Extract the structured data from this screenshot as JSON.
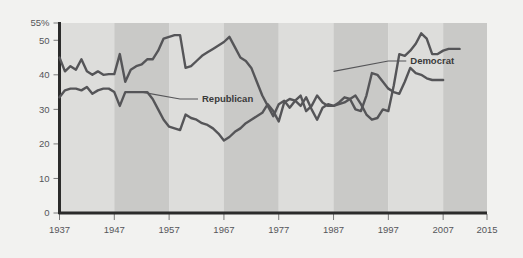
{
  "chart_data": {
    "type": "line",
    "title": "",
    "subtitle": "",
    "xlabel": "",
    "ylabel": "",
    "xlim": [
      1937,
      2015
    ],
    "ylim": [
      0,
      55
    ],
    "grid": false,
    "legend_position": "inline-annotation",
    "y_ticks": [
      0,
      10,
      20,
      30,
      40,
      50,
      55
    ],
    "y_tick_labels": [
      "0",
      "10",
      "20",
      "30",
      "40",
      "50",
      "55%"
    ],
    "x_ticks": [
      1937,
      1947,
      1957,
      1967,
      1977,
      1987,
      1997,
      2007,
      2015
    ],
    "x_tick_labels": [
      "1937",
      "1947",
      "1957",
      "1967",
      "1977",
      "1987",
      "1997",
      "2007",
      "2015"
    ],
    "band_shading": {
      "light_color": "#dddddb",
      "dark_color": "#c9c9c7",
      "period_years": 10,
      "start_year": 1937
    },
    "series": [
      {
        "name": "Democrat",
        "label": "Democrat",
        "color": "#555558",
        "label_x": 2001,
        "label_y": 44,
        "points": [
          [
            1937,
            45.0
          ],
          [
            1938,
            41.0
          ],
          [
            1939,
            42.5
          ],
          [
            1940,
            41.5
          ],
          [
            1941,
            44.5
          ],
          [
            1942,
            41.0
          ],
          [
            1943,
            40.0
          ],
          [
            1944,
            41.0
          ],
          [
            1945,
            40.0
          ],
          [
            1946,
            40.2
          ],
          [
            1947,
            40.2
          ],
          [
            1948,
            46.0
          ],
          [
            1949,
            38.0
          ],
          [
            1950,
            41.5
          ],
          [
            1951,
            42.5
          ],
          [
            1952,
            43.0
          ],
          [
            1953,
            44.5
          ],
          [
            1954,
            44.5
          ],
          [
            1955,
            47.0
          ],
          [
            1956,
            50.5
          ],
          [
            1957,
            51.0
          ],
          [
            1958,
            51.5
          ],
          [
            1959,
            51.5
          ],
          [
            1960,
            42.0
          ],
          [
            1961,
            42.5
          ],
          [
            1962,
            44.0
          ],
          [
            1963,
            45.5
          ],
          [
            1964,
            46.5
          ],
          [
            1965,
            47.5
          ],
          [
            1966,
            48.5
          ],
          [
            1967,
            49.5
          ],
          [
            1968,
            51.0
          ],
          [
            1969,
            48.0
          ],
          [
            1970,
            45.0
          ],
          [
            1971,
            44.0
          ],
          [
            1972,
            42.0
          ],
          [
            1973,
            38.0
          ],
          [
            1974,
            34.0
          ],
          [
            1975,
            31.0
          ],
          [
            1976,
            28.0
          ],
          [
            1977,
            31.5
          ],
          [
            1978,
            32.5
          ],
          [
            1979,
            30.5
          ],
          [
            1980,
            32.5
          ],
          [
            1981,
            31.0
          ],
          [
            1982,
            33.5
          ],
          [
            1983,
            30.0
          ],
          [
            1984,
            27.0
          ],
          [
            1985,
            30.5
          ],
          [
            1986,
            31.5
          ],
          [
            1987,
            31.0
          ],
          [
            1988,
            31.5
          ],
          [
            1989,
            32.0
          ],
          [
            1990,
            33.0
          ],
          [
            1991,
            34.0
          ],
          [
            1992,
            31.5
          ],
          [
            1993,
            28.5
          ],
          [
            1994,
            27.0
          ],
          [
            1995,
            27.5
          ],
          [
            1996,
            30.0
          ],
          [
            1997,
            29.5
          ],
          [
            1998,
            37.0
          ],
          [
            1999,
            46.0
          ],
          [
            2000,
            45.5
          ],
          [
            2001,
            47.0
          ],
          [
            2002,
            49.0
          ],
          [
            2003,
            52.0
          ],
          [
            2004,
            50.5
          ],
          [
            2005,
            46.0
          ],
          [
            2006,
            46.0
          ],
          [
            2007,
            47.0
          ],
          [
            2008,
            47.5
          ],
          [
            2009,
            47.5
          ],
          [
            2010,
            47.5
          ]
        ]
      },
      {
        "name": "Republican",
        "label": "Republican",
        "color": "#555558",
        "label_x": 1963,
        "label_y": 33,
        "points": [
          [
            1937,
            33.5
          ],
          [
            1938,
            35.5
          ],
          [
            1939,
            36.0
          ],
          [
            1940,
            36.0
          ],
          [
            1941,
            35.5
          ],
          [
            1942,
            36.5
          ],
          [
            1943,
            34.5
          ],
          [
            1944,
            35.5
          ],
          [
            1945,
            36.0
          ],
          [
            1946,
            36.0
          ],
          [
            1947,
            35.0
          ],
          [
            1948,
            31.0
          ],
          [
            1949,
            35.0
          ],
          [
            1950,
            35.0
          ],
          [
            1951,
            35.0
          ],
          [
            1952,
            35.0
          ],
          [
            1953,
            35.0
          ],
          [
            1954,
            33.0
          ],
          [
            1955,
            30.0
          ],
          [
            1956,
            27.0
          ],
          [
            1957,
            25.0
          ],
          [
            1958,
            24.5
          ],
          [
            1959,
            24.0
          ],
          [
            1960,
            28.5
          ],
          [
            1961,
            27.5
          ],
          [
            1962,
            27.0
          ],
          [
            1963,
            26.0
          ],
          [
            1964,
            25.5
          ],
          [
            1965,
            24.5
          ],
          [
            1966,
            23.0
          ],
          [
            1967,
            21.0
          ],
          [
            1968,
            22.0
          ],
          [
            1969,
            23.5
          ],
          [
            1970,
            24.5
          ],
          [
            1971,
            26.0
          ],
          [
            1972,
            27.0
          ],
          [
            1973,
            28.0
          ],
          [
            1974,
            29.0
          ],
          [
            1975,
            31.5
          ],
          [
            1976,
            29.5
          ],
          [
            1977,
            26.5
          ],
          [
            1978,
            32.0
          ],
          [
            1979,
            33.0
          ],
          [
            1980,
            32.5
          ],
          [
            1981,
            34.0
          ],
          [
            1982,
            29.5
          ],
          [
            1983,
            31.0
          ],
          [
            1984,
            34.0
          ],
          [
            1985,
            32.0
          ],
          [
            1986,
            31.0
          ],
          [
            1987,
            31.0
          ],
          [
            1988,
            32.0
          ],
          [
            1989,
            33.5
          ],
          [
            1990,
            33.0
          ],
          [
            1991,
            30.0
          ],
          [
            1992,
            29.5
          ],
          [
            1993,
            34.0
          ],
          [
            1994,
            40.5
          ],
          [
            1995,
            40.0
          ],
          [
            1996,
            38.0
          ],
          [
            1997,
            36.0
          ],
          [
            1998,
            35.0
          ],
          [
            1999,
            34.5
          ],
          [
            2000,
            38.0
          ],
          [
            2001,
            42.0
          ],
          [
            2002,
            40.5
          ],
          [
            2003,
            40.0
          ],
          [
            2004,
            39.0
          ],
          [
            2005,
            38.5
          ],
          [
            2006,
            38.5
          ],
          [
            2007,
            38.5
          ]
        ]
      }
    ],
    "annotations": [
      {
        "text": "Democrat",
        "leader_from_year": 1987,
        "leader_from_value": 41
      },
      {
        "text": "Republican",
        "leader_from_year": 1952,
        "leader_from_value": 35
      }
    ]
  },
  "axis": {
    "y_axis_name": "percent-axis",
    "x_axis_name": "year-axis"
  }
}
